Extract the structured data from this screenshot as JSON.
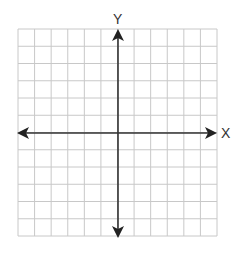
{
  "chart_data": {
    "type": "coordinate-grid",
    "title": "",
    "xlabel": "X",
    "ylabel": "Y",
    "grid": true,
    "columns": 12,
    "rows": 12,
    "xlim": [
      -6,
      6
    ],
    "ylim": [
      -6,
      6
    ],
    "x_ticks_labeled": false,
    "y_ticks_labeled": false,
    "axes_arrows": [
      "left",
      "right",
      "up",
      "down"
    ],
    "data_points": []
  },
  "labels": {
    "x_axis": "X",
    "y_axis": "Y"
  },
  "colors": {
    "grid": "#c8c8c8",
    "axis": "#333333",
    "background": "#ffffff"
  }
}
